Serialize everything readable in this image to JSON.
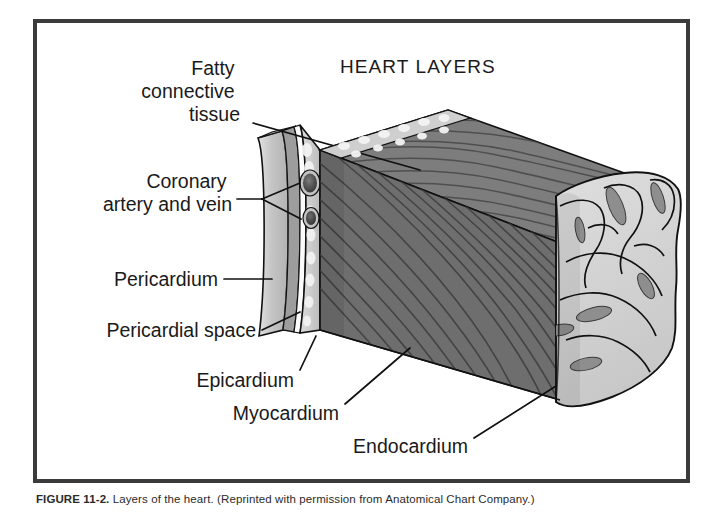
{
  "figure": {
    "title": "HEART LAYERS",
    "caption_label": "FIGURE 11-2.",
    "caption_text": "Layers of the heart. (Reprinted with permission from Anatomical Chart Company.)"
  },
  "labels": {
    "fatty_connective_tissue_line1": "Fatty",
    "fatty_connective_tissue_line2": "connective",
    "fatty_connective_tissue_line3": "tissue",
    "coronary_line1": "Coronary",
    "coronary_line2": "artery and vein",
    "pericardium": "Pericardium",
    "pericardial_space": "Pericardial space",
    "epicardium": "Epicardium",
    "myocardium": "Myocardium",
    "endocardium": "Endocardium"
  },
  "colors": {
    "frame": "#3b3b3b",
    "background": "#ffffff",
    "pericardium_outer": "#c9c9c9",
    "pericardium_band": "#9a9a9a",
    "pericardial_space": "#fdfdfd",
    "epicardium_fat": "#d2d2d2",
    "myocardium_front": "#6e6e6e",
    "myocardium_top": "#7d7d7d",
    "myocardium_fiber": "#3c3c3c",
    "endocardium": "#d5d5d5",
    "vessel_dark": "#4a4a4a",
    "outline": "#111111",
    "text": "#1a1a1a"
  }
}
